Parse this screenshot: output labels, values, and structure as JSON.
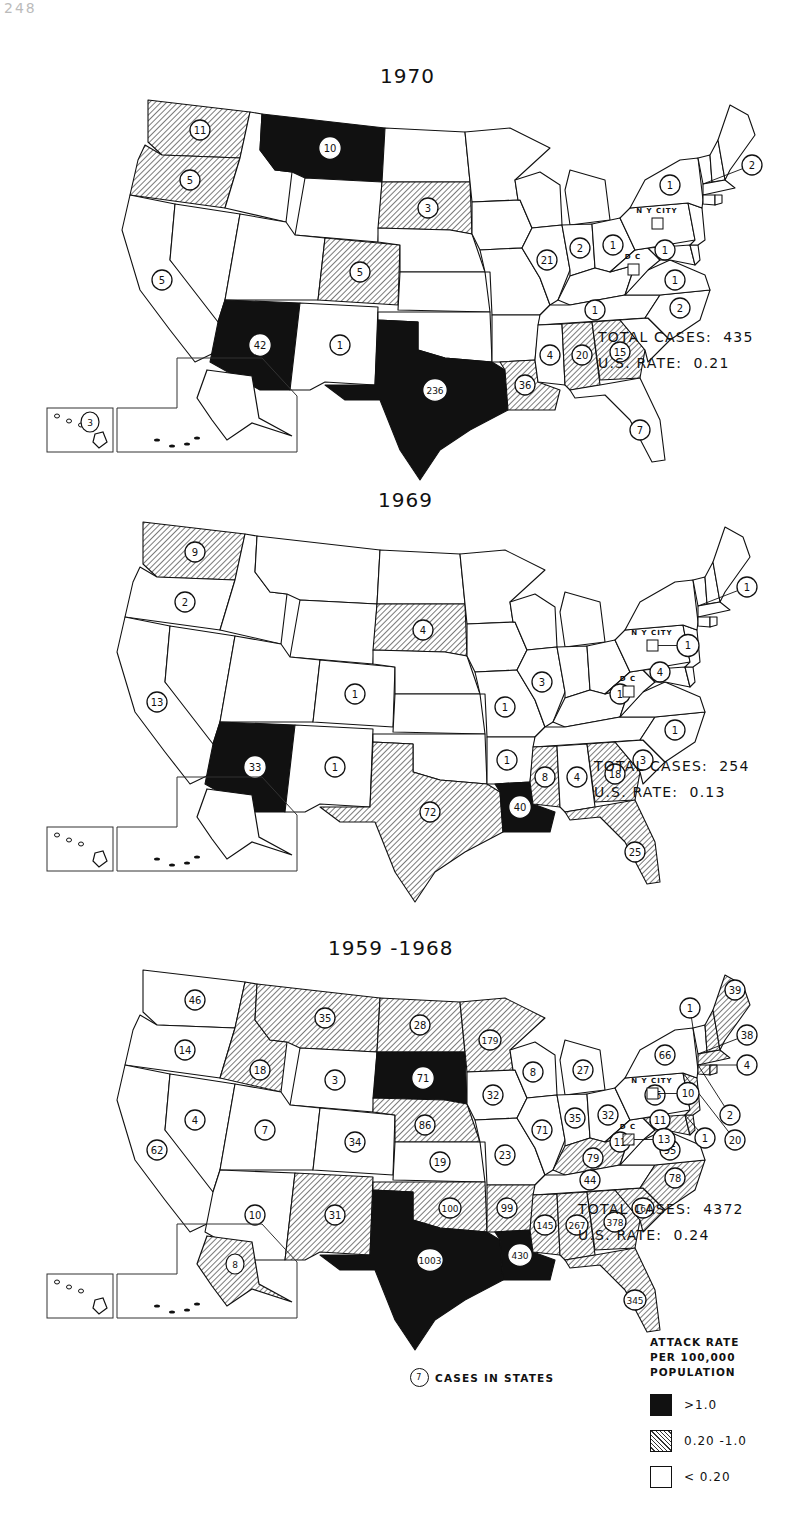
{
  "page_number": "248",
  "legend": {
    "title_lines": [
      "ATTACK RATE",
      "PER 100,000",
      "POPULATION"
    ],
    "items": [
      {
        "class": "high",
        "label": ">1.0"
      },
      {
        "class": "mid",
        "label": "0.20 -1.0"
      },
      {
        "class": "low",
        "label": "< 0.20"
      }
    ],
    "cases_key_value": "7",
    "cases_key_label": "CASES IN STATES"
  },
  "labels": {
    "nyc": "N Y CITY",
    "dc": "D C"
  },
  "maps": [
    {
      "id": "1970",
      "title": "1970",
      "total_cases_label": "TOTAL CASES:",
      "total_cases": "435",
      "us_rate_label": "U.S. RATE:",
      "us_rate": "0.21",
      "states": {
        "WA": {
          "rate": "mid",
          "cases": "11"
        },
        "OR": {
          "rate": "mid",
          "cases": "5"
        },
        "CA": {
          "rate": "low",
          "cases": "5"
        },
        "ID": {
          "rate": "low"
        },
        "NV": {
          "rate": "low"
        },
        "MT": {
          "rate": "high",
          "cases": "10"
        },
        "WY": {
          "rate": "low"
        },
        "UT": {
          "rate": "low"
        },
        "AZ": {
          "rate": "high",
          "cases": "42"
        },
        "CO": {
          "rate": "mid",
          "cases": "5"
        },
        "NM": {
          "rate": "low",
          "cases": "1"
        },
        "ND": {
          "rate": "low"
        },
        "SD": {
          "rate": "mid",
          "cases": "3"
        },
        "NE": {
          "rate": "low"
        },
        "KS": {
          "rate": "low"
        },
        "OK": {
          "rate": "low"
        },
        "TX": {
          "rate": "high",
          "cases": "236"
        },
        "MN": {
          "rate": "low"
        },
        "IA": {
          "rate": "low"
        },
        "MO": {
          "rate": "low"
        },
        "AR": {
          "rate": "low"
        },
        "LA": {
          "rate": "mid",
          "cases": "36"
        },
        "WI": {
          "rate": "low"
        },
        "IL": {
          "rate": "low",
          "cases": "21"
        },
        "MI": {
          "rate": "low"
        },
        "IN": {
          "rate": "low",
          "cases": "2"
        },
        "OH": {
          "rate": "low",
          "cases": "1"
        },
        "KY": {
          "rate": "low"
        },
        "TN": {
          "rate": "low",
          "cases": "1"
        },
        "MS": {
          "rate": "low",
          "cases": "4"
        },
        "AL": {
          "rate": "mid",
          "cases": "20"
        },
        "GA": {
          "rate": "mid",
          "cases": "15"
        },
        "FL": {
          "rate": "low",
          "cases": "7"
        },
        "SC": {
          "rate": "low"
        },
        "NC": {
          "rate": "low",
          "cases": "2"
        },
        "VA": {
          "rate": "low",
          "cases": "1"
        },
        "WV": {
          "rate": "low"
        },
        "MD": {
          "rate": "low",
          "cases": "1"
        },
        "DE": {
          "rate": "low"
        },
        "PA": {
          "rate": "low"
        },
        "NJ": {
          "rate": "low"
        },
        "NY": {
          "rate": "low",
          "cases": "1"
        },
        "CT": {
          "rate": "low"
        },
        "RI": {
          "rate": "low"
        },
        "MA": {
          "rate": "low",
          "cases": "2"
        },
        "VT": {
          "rate": "low"
        },
        "NH": {
          "rate": "low"
        },
        "ME": {
          "rate": "low"
        },
        "AK": {
          "rate": "low"
        },
        "HI": {
          "rate": "low",
          "cases": "3"
        },
        "NYC": {
          "rate": "low"
        },
        "DC": {
          "rate": "low"
        }
      }
    },
    {
      "id": "1969",
      "title": "1969",
      "total_cases_label": "TOTAL CASES:",
      "total_cases": "254",
      "us_rate_label": "U.S. RATE:",
      "us_rate": "0.13",
      "states": {
        "WA": {
          "rate": "mid",
          "cases": "9"
        },
        "OR": {
          "rate": "low",
          "cases": "2"
        },
        "CA": {
          "rate": "low",
          "cases": "13"
        },
        "ID": {
          "rate": "low"
        },
        "NV": {
          "rate": "low"
        },
        "MT": {
          "rate": "low"
        },
        "WY": {
          "rate": "low"
        },
        "UT": {
          "rate": "low"
        },
        "AZ": {
          "rate": "high",
          "cases": "33"
        },
        "CO": {
          "rate": "low",
          "cases": "1"
        },
        "NM": {
          "rate": "low",
          "cases": "1"
        },
        "ND": {
          "rate": "low"
        },
        "SD": {
          "rate": "mid",
          "cases": "4"
        },
        "NE": {
          "rate": "low"
        },
        "KS": {
          "rate": "low"
        },
        "OK": {
          "rate": "low"
        },
        "TX": {
          "rate": "mid",
          "cases": "72"
        },
        "MN": {
          "rate": "low"
        },
        "IA": {
          "rate": "low"
        },
        "MO": {
          "rate": "low",
          "cases": "1"
        },
        "AR": {
          "rate": "low",
          "cases": "1"
        },
        "LA": {
          "rate": "high",
          "cases": "40"
        },
        "WI": {
          "rate": "low"
        },
        "IL": {
          "rate": "low",
          "cases": "3"
        },
        "MI": {
          "rate": "low"
        },
        "IN": {
          "rate": "low"
        },
        "OH": {
          "rate": "low"
        },
        "KY": {
          "rate": "low"
        },
        "TN": {
          "rate": "low"
        },
        "MS": {
          "rate": "mid",
          "cases": "8"
        },
        "AL": {
          "rate": "low",
          "cases": "4"
        },
        "GA": {
          "rate": "mid",
          "cases": "18"
        },
        "FL": {
          "rate": "mid",
          "cases": "25"
        },
        "SC": {
          "rate": "low",
          "cases": "3"
        },
        "NC": {
          "rate": "low",
          "cases": "1"
        },
        "VA": {
          "rate": "low"
        },
        "WV": {
          "rate": "low",
          "cases": "1"
        },
        "MD": {
          "rate": "low",
          "cases": "4"
        },
        "DE": {
          "rate": "low"
        },
        "PA": {
          "rate": "low"
        },
        "NJ": {
          "rate": "low"
        },
        "NY": {
          "rate": "low"
        },
        "CT": {
          "rate": "low"
        },
        "RI": {
          "rate": "low"
        },
        "MA": {
          "rate": "low",
          "cases": "1"
        },
        "VT": {
          "rate": "low"
        },
        "NH": {
          "rate": "low"
        },
        "ME": {
          "rate": "low"
        },
        "AK": {
          "rate": "low"
        },
        "HI": {
          "rate": "low"
        },
        "NYC": {
          "rate": "low",
          "cases": "1"
        },
        "DC": {
          "rate": "low"
        }
      }
    },
    {
      "id": "1959-1968",
      "title": "1959 -1968",
      "total_cases_label": "TOTAL CASES:",
      "total_cases": "4372",
      "us_rate_label": "U.S. RATE:",
      "us_rate": "0.24",
      "states": {
        "WA": {
          "rate": "low",
          "cases": "46"
        },
        "OR": {
          "rate": "low",
          "cases": "14"
        },
        "CA": {
          "rate": "low",
          "cases": "62"
        },
        "ID": {
          "rate": "mid",
          "cases": "18"
        },
        "NV": {
          "rate": "low",
          "cases": "4"
        },
        "MT": {
          "rate": "mid",
          "cases": "35"
        },
        "WY": {
          "rate": "low",
          "cases": "3"
        },
        "UT": {
          "rate": "low",
          "cases": "7"
        },
        "AZ": {
          "rate": "low",
          "cases": "10"
        },
        "CO": {
          "rate": "low",
          "cases": "34"
        },
        "NM": {
          "rate": "mid",
          "cases": "31"
        },
        "ND": {
          "rate": "mid",
          "cases": "28"
        },
        "SD": {
          "rate": "high",
          "cases": "71"
        },
        "NE": {
          "rate": "mid",
          "cases": "86"
        },
        "KS": {
          "rate": "low",
          "cases": "19"
        },
        "OK": {
          "rate": "mid",
          "cases": "100"
        },
        "TX": {
          "rate": "high",
          "cases": "1003"
        },
        "MN": {
          "rate": "mid",
          "cases": "179"
        },
        "IA": {
          "rate": "low",
          "cases": "32"
        },
        "MO": {
          "rate": "low",
          "cases": "23"
        },
        "AR": {
          "rate": "mid",
          "cases": "99"
        },
        "LA": {
          "rate": "high",
          "cases": "430"
        },
        "WI": {
          "rate": "low",
          "cases": "8"
        },
        "IL": {
          "rate": "low",
          "cases": "71"
        },
        "MI": {
          "rate": "low",
          "cases": "27"
        },
        "IN": {
          "rate": "low",
          "cases": "35"
        },
        "OH": {
          "rate": "low",
          "cases": "32"
        },
        "KY": {
          "rate": "mid",
          "cases": "79"
        },
        "TN": {
          "rate": "low",
          "cases": "44"
        },
        "MS": {
          "rate": "mid",
          "cases": "145"
        },
        "AL": {
          "rate": "mid",
          "cases": "267"
        },
        "GA": {
          "rate": "mid",
          "cases": "378"
        },
        "FL": {
          "rate": "mid",
          "cases": "345"
        },
        "SC": {
          "rate": "mid",
          "cases": "164"
        },
        "NC": {
          "rate": "mid",
          "cases": "78"
        },
        "VA": {
          "rate": "low",
          "cases": "95"
        },
        "WV": {
          "rate": "low",
          "cases": "11"
        },
        "MD": {
          "rate": "mid",
          "cases": "11"
        },
        "DE": {
          "rate": "mid",
          "cases": "1"
        },
        "PA": {
          "rate": "low",
          "cases": "56"
        },
        "NJ": {
          "rate": "mid",
          "cases": "20"
        },
        "NY": {
          "rate": "low",
          "cases": "66"
        },
        "CT": {
          "rate": "mid",
          "cases": "2"
        },
        "RI": {
          "rate": "mid",
          "cases": "4"
        },
        "MA": {
          "rate": "mid",
          "cases": "38"
        },
        "VT": {
          "rate": "low",
          "cases": "1"
        },
        "NH": {
          "rate": "mid"
        },
        "ME": {
          "rate": "mid",
          "cases": "39"
        },
        "AK": {
          "rate": "mid",
          "cases": "8"
        },
        "HI": {
          "rate": "low"
        },
        "NYC": {
          "rate": "low",
          "cases": "10"
        },
        "DC": {
          "rate": "mid",
          "cases": "13"
        }
      }
    }
  ]
}
